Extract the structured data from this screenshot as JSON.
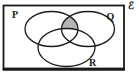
{
  "diagram": {
    "kind": "three-set-venn-diagram",
    "universal_set_label": "ℰ",
    "set_labels": {
      "left": "P",
      "right": "Q",
      "bottom": "R"
    },
    "shaded_region": "(P ∩ Q) outside R",
    "colors": {
      "shade_fill": "#b3b3b3",
      "stroke": "#1a1a1a",
      "background": "#ffffff"
    }
  }
}
